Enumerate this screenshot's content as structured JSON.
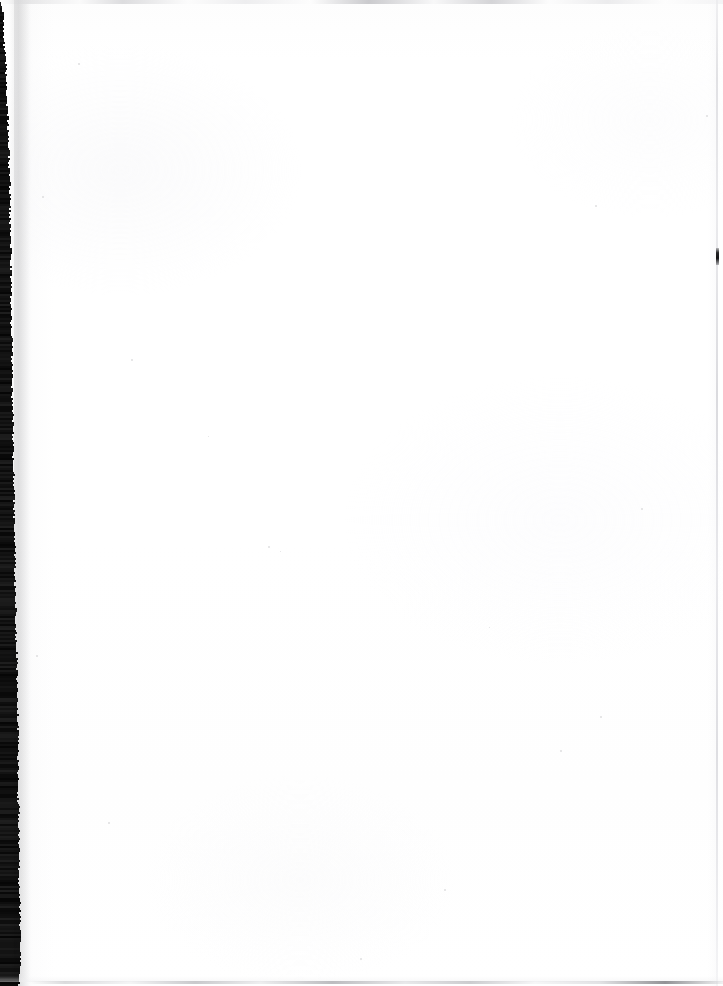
{
  "document": {
    "type": "scanned-page",
    "page_content": "",
    "page_text": "",
    "is_blank": true,
    "width_px": 723,
    "height_px": 986
  },
  "scan": {
    "paper_color": "#ffffff",
    "gutter_color": "#060606",
    "edge_line_color": "#d6d6da",
    "top_streak_color": "#cfcfd2",
    "bottom_edge_color": "#b4b4b8",
    "right_edge_mark_color": "#141416",
    "gutter_label": "",
    "notes": ""
  },
  "artifacts": {
    "left_gutter_band": "",
    "top_scan_streak": "",
    "bottom_page_edge": "",
    "right_page_edge": "",
    "right_edge_defect": ""
  },
  "specks": [
    {
      "x": 78,
      "y": 63,
      "size": 2
    },
    {
      "x": 131,
      "y": 359,
      "size": 2
    },
    {
      "x": 268,
      "y": 546,
      "size": 2
    },
    {
      "x": 280,
      "y": 551,
      "size": 1
    },
    {
      "x": 595,
      "y": 205,
      "size": 2
    },
    {
      "x": 641,
      "y": 508,
      "size": 2
    },
    {
      "x": 600,
      "y": 716,
      "size": 2
    },
    {
      "x": 560,
      "y": 750,
      "size": 2
    },
    {
      "x": 360,
      "y": 958,
      "size": 2
    },
    {
      "x": 444,
      "y": 889,
      "size": 2
    },
    {
      "x": 706,
      "y": 115,
      "size": 2
    },
    {
      "x": 108,
      "y": 822,
      "size": 2
    },
    {
      "x": 42,
      "y": 196,
      "size": 2
    },
    {
      "x": 36,
      "y": 655,
      "size": 2
    },
    {
      "x": 489,
      "y": 627,
      "size": 1
    },
    {
      "x": 208,
      "y": 436,
      "size": 1
    }
  ],
  "gutter_profile": [
    {
      "y": 0,
      "w": 0
    },
    {
      "y": 12,
      "w": 3
    },
    {
      "y": 40,
      "w": 4
    },
    {
      "y": 70,
      "w": 6
    },
    {
      "y": 100,
      "w": 7
    },
    {
      "y": 130,
      "w": 8
    },
    {
      "y": 160,
      "w": 9
    },
    {
      "y": 190,
      "w": 10
    },
    {
      "y": 220,
      "w": 10
    },
    {
      "y": 250,
      "w": 11
    },
    {
      "y": 280,
      "w": 11
    },
    {
      "y": 310,
      "w": 11
    },
    {
      "y": 340,
      "w": 12
    },
    {
      "y": 370,
      "w": 12
    },
    {
      "y": 400,
      "w": 12
    },
    {
      "y": 430,
      "w": 13
    },
    {
      "y": 460,
      "w": 13
    },
    {
      "y": 490,
      "w": 14
    },
    {
      "y": 520,
      "w": 14
    },
    {
      "y": 550,
      "w": 15
    },
    {
      "y": 580,
      "w": 15
    },
    {
      "y": 610,
      "w": 16
    },
    {
      "y": 640,
      "w": 16
    },
    {
      "y": 670,
      "w": 17
    },
    {
      "y": 700,
      "w": 17
    },
    {
      "y": 730,
      "w": 18
    },
    {
      "y": 760,
      "w": 18
    },
    {
      "y": 790,
      "w": 18
    },
    {
      "y": 820,
      "w": 19
    },
    {
      "y": 850,
      "w": 19
    },
    {
      "y": 880,
      "w": 19
    },
    {
      "y": 910,
      "w": 20
    },
    {
      "y": 940,
      "w": 20
    },
    {
      "y": 965,
      "w": 20
    },
    {
      "y": 979,
      "w": 19
    }
  ]
}
